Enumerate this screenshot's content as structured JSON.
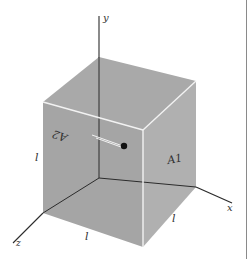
{
  "figure": {
    "axes": {
      "x_label": "x",
      "y_label": "y",
      "z_label": "z"
    },
    "face_labels": {
      "right_face": "A1",
      "front_face": "A2"
    },
    "edge_labels": {
      "left_vertical": "l",
      "bottom_front": "l",
      "bottom_right": "l"
    },
    "colors": {
      "top_face": "#a9a9a9",
      "front_face": "#a4a4a4",
      "right_face": "#b0b0b0",
      "edge_highlight": "#f2f2f2",
      "axis": "#2b2b2b",
      "particle": "#111111",
      "background": "#ffffff"
    }
  }
}
